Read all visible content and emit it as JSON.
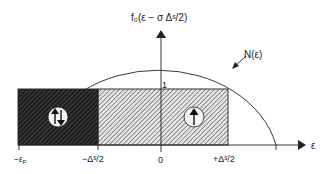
{
  "diagram": {
    "y_axis_label": "f₀(ε − σ Δˢ/2)",
    "x_axis_label": "ε",
    "y_tick_label": "1",
    "curve_label": "N(ε)",
    "x_ticks": [
      {
        "label": "−ε",
        "sub": "F"
      },
      {
        "label": "−Δˢ/2"
      },
      {
        "label": "0"
      },
      {
        "label": "+Δˢ/2"
      }
    ],
    "regions": [
      {
        "name": "paired-region",
        "symbol": "up-down-arrows",
        "fill": "dark-hatch"
      },
      {
        "name": "polarized-region",
        "symbol": "up-arrow",
        "fill": "light-hatch"
      }
    ],
    "colors": {
      "line": "#222222",
      "dark_fill": "#2a2a2a",
      "light_hatch": "#555555",
      "background": "#ffffff"
    }
  }
}
